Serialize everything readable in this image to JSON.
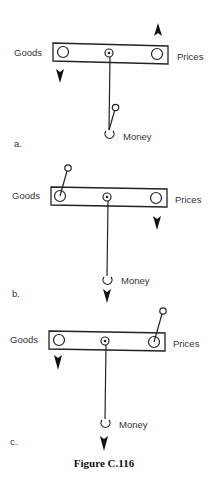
{
  "figure": {
    "caption": "Figure C.116",
    "panels": [
      {
        "id": "a",
        "label": "a.",
        "left_label": "Goods",
        "right_label": "Prices",
        "bottom_label": "Money",
        "weight_position": "hanging-tilted-on-money-string",
        "arrows": [
          {
            "position": "goods",
            "direction": "down"
          },
          {
            "position": "prices",
            "direction": "up"
          }
        ]
      },
      {
        "id": "b",
        "label": "b.",
        "left_label": "Goods",
        "right_label": "Prices",
        "bottom_label": "Money",
        "weight_position": "on-goods-end",
        "arrows": [
          {
            "position": "prices",
            "direction": "down"
          },
          {
            "position": "money",
            "direction": "down"
          }
        ]
      },
      {
        "id": "c",
        "label": "c.",
        "left_label": "Goods",
        "right_label": "Prices",
        "bottom_label": "Money",
        "weight_position": "on-prices-end",
        "arrows": [
          {
            "position": "goods",
            "direction": "down"
          },
          {
            "position": "money",
            "direction": "down"
          }
        ]
      }
    ]
  },
  "colors": {
    "line": "#222222",
    "text": "#333333",
    "background": "#ffffff"
  }
}
